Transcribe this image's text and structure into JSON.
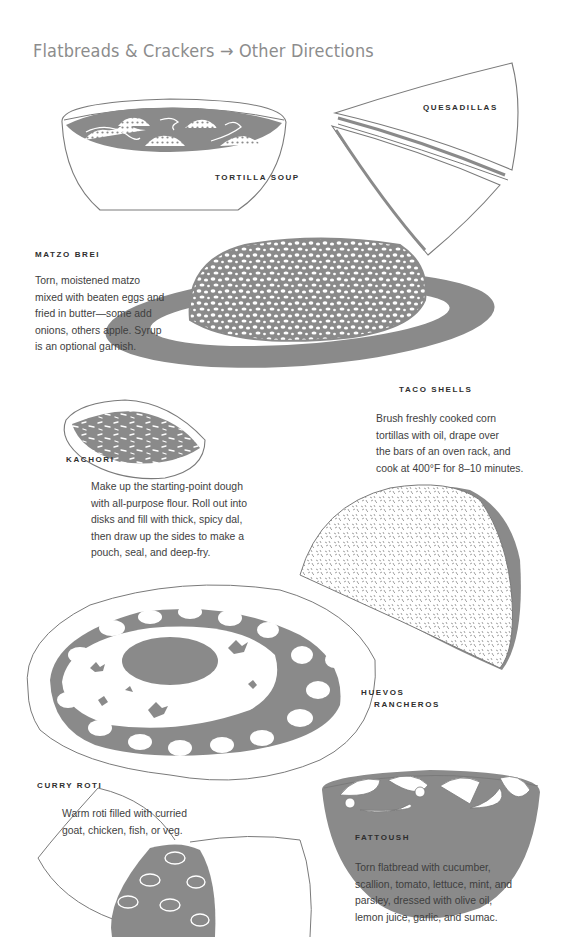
{
  "page": {
    "title": "Flatbreads & Crackers → Other Directions"
  },
  "colors": {
    "ink_fill": "#8a8a8a",
    "outline": "#7a7a7a",
    "title": "#8c8c8c",
    "text": "#3e3e3e",
    "label": "#2e2e2e",
    "background": "#ffffff"
  },
  "entries": {
    "tortilla_soup": {
      "label": "TORTILLA SOUP"
    },
    "quesadillas": {
      "label": "QUESADILLAS"
    },
    "matzo_brei": {
      "label": "MATZO BREI",
      "lines": [
        "Torn, moistened matzo",
        "mixed with beaten eggs and",
        "fried in butter—some add",
        "onions, others apple. Syrup",
        "is an optional garnish."
      ]
    },
    "taco_shells": {
      "label": "TACO SHELLS",
      "lines": [
        "Brush freshly cooked corn",
        "tortillas with oil, drape over",
        "the bars of an oven rack, and",
        "cook at 400°F for 8–10 minutes."
      ]
    },
    "kachori": {
      "label": "KACHORI",
      "lines": [
        "Make up the starting-point dough",
        "with all-purpose flour. Roll out into",
        "disks and fill with thick, spicy dal,",
        "then draw up the sides to make a",
        "pouch, seal, and deep-fry."
      ]
    },
    "huevos_rancheros": {
      "label_line1": "HUEVOS",
      "label_line2": "RANCHEROS"
    },
    "curry_roti": {
      "label": "CURRY ROTI",
      "lines": [
        "Warm roti filled with curried",
        "goat, chicken, fish, or veg."
      ]
    },
    "fattoush": {
      "label": "FATTOUSH",
      "lines": [
        "Torn flatbread with cucumber,",
        "scallion, tomato, lettuce, mint, and",
        "parsley, dressed with olive oil,",
        "lemon juice, garlic, and sumac."
      ]
    }
  },
  "illustrations": [
    {
      "name": "tortilla-soup-bowl",
      "icon": "soup-bowl-icon"
    },
    {
      "name": "quesadilla-wedges",
      "icon": "quesadilla-icon"
    },
    {
      "name": "matzo-brei-plate",
      "icon": "plate-icon"
    },
    {
      "name": "kachori-pastry",
      "icon": "kachori-icon"
    },
    {
      "name": "taco-shell",
      "icon": "taco-icon"
    },
    {
      "name": "huevos-rancheros-plate",
      "icon": "egg-plate-icon"
    },
    {
      "name": "curry-roti-wrap",
      "icon": "roti-icon"
    },
    {
      "name": "fattoush-bowl",
      "icon": "salad-bowl-icon"
    }
  ]
}
